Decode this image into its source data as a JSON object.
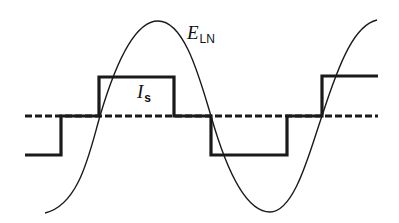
{
  "diagram": {
    "labels": {
      "voltage": {
        "main": "E",
        "sub": "LN"
      },
      "current": {
        "main": "I",
        "sub": "s"
      }
    },
    "colors": {
      "stroke": "#1a1a1a",
      "background": "#ffffff"
    }
  }
}
